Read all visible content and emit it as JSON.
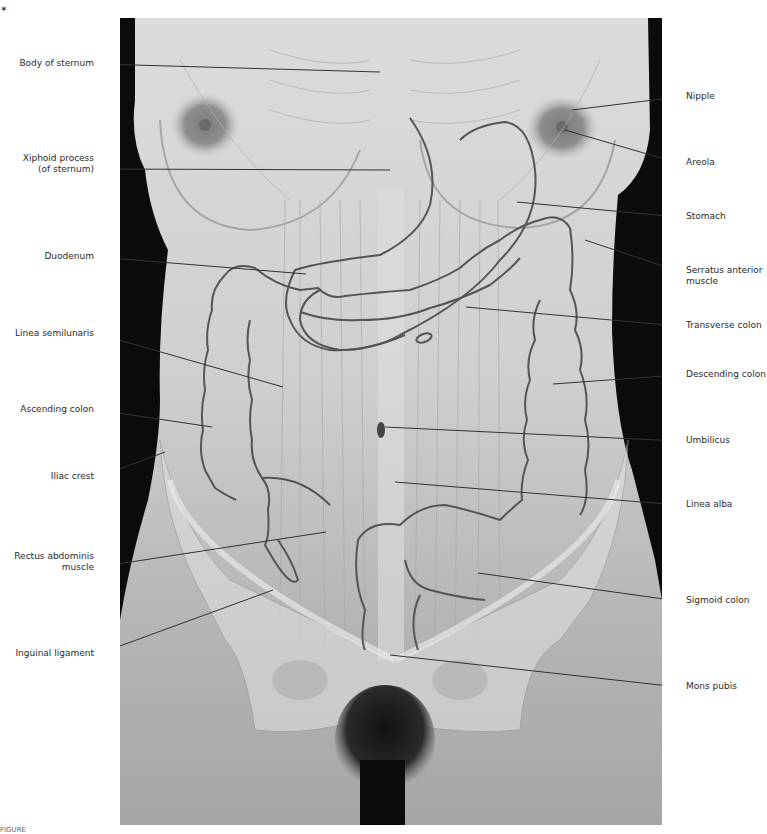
{
  "figure": {
    "corner_mark": "✶",
    "caption_fragment": "FIGURE",
    "colors": {
      "background_dark": "#0b0b0b",
      "skin_light": "#d9d9d9",
      "skin_mid": "#bdbdbd",
      "skin_lower": "#a9a9a9",
      "organ_outline": "#555555",
      "leader_line": "#333333",
      "label_text": "#2a2a2a",
      "pelvis_overlay": "#e6e6e6"
    }
  },
  "labels_left": [
    {
      "id": "body-of-sternum",
      "lines": [
        "Body of sternum"
      ]
    },
    {
      "id": "xiphoid-process",
      "lines": [
        "Xiphoid process",
        "(of sternum)"
      ]
    },
    {
      "id": "duodenum",
      "lines": [
        "Duodenum"
      ]
    },
    {
      "id": "linea-semilunaris",
      "lines": [
        "Linea semilunaris"
      ]
    },
    {
      "id": "ascending-colon",
      "lines": [
        "Ascending colon"
      ]
    },
    {
      "id": "iliac-crest",
      "lines": [
        "Iliac crest"
      ]
    },
    {
      "id": "rectus-abdominis",
      "lines": [
        "Rectus abdominis",
        "muscle"
      ]
    },
    {
      "id": "inguinal-ligament",
      "lines": [
        "Inguinal ligament"
      ]
    }
  ],
  "labels_right": [
    {
      "id": "nipple",
      "lines": [
        "Nipple"
      ]
    },
    {
      "id": "areola",
      "lines": [
        "Areola"
      ]
    },
    {
      "id": "stomach",
      "lines": [
        "Stomach"
      ]
    },
    {
      "id": "serratus-anterior",
      "lines": [
        "Serratus anterior",
        "muscle"
      ]
    },
    {
      "id": "transverse-colon",
      "lines": [
        "Transverse colon"
      ]
    },
    {
      "id": "descending-colon",
      "lines": [
        "Descending colon"
      ]
    },
    {
      "id": "umbilicus",
      "lines": [
        "Umbilicus"
      ]
    },
    {
      "id": "linea-alba",
      "lines": [
        "Linea alba"
      ]
    },
    {
      "id": "sigmoid-colon",
      "lines": [
        "Sigmoid colon"
      ]
    },
    {
      "id": "mons-pubis",
      "lines": [
        "Mons pubis"
      ]
    }
  ]
}
